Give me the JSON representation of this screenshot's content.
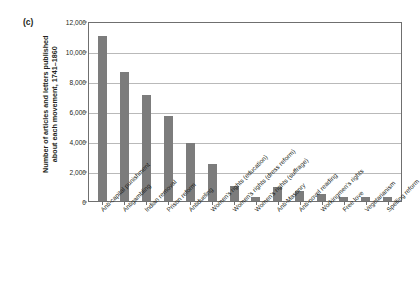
{
  "figure": {
    "panel_label": "(c)"
  },
  "chart_data": {
    "type": "bar",
    "title": "",
    "subtitle": "",
    "xlabel": "",
    "ylabel": "Number of articles and letters published about each movement, 1741–1860",
    "ylabel_line1": "Number of articles and letters published",
    "ylabel_line2": "about each movement, 1741–1860",
    "ylim": [
      0,
      12000
    ],
    "ytick_labels": [
      "0",
      "2,000",
      "4,000",
      "6,000",
      "8,000",
      "10,000",
      "12,000"
    ],
    "ytick_values": [
      0,
      2000,
      4000,
      6000,
      8000,
      10000,
      12000
    ],
    "grid": true,
    "grid_axis": "y",
    "legend": false,
    "bar_color": "#7c7c7c",
    "categories": [
      "Anti-capital punishment",
      "Antigambling",
      "Indian removal",
      "Prison reform",
      "Antidueling",
      "Women's rights (education)",
      "Women's rights (dress reform)",
      "Women's rights (suffrage)",
      "Anti-Masonry",
      "Anti-novel reading",
      "Workingmen's rights",
      "Free love",
      "Vegetarianism",
      "Spelling reform"
    ],
    "values": [
      11000,
      8600,
      7100,
      5700,
      3900,
      2450,
      1000,
      250,
      950,
      700,
      450,
      300,
      300,
      280
    ]
  }
}
